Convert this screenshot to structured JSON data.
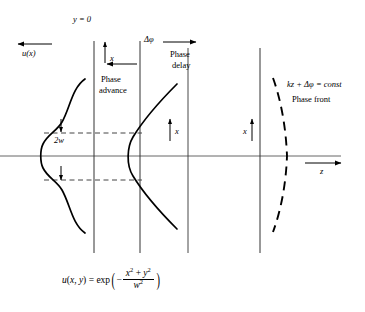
{
  "figure": {
    "axes": {
      "z_axis_label": "z",
      "plane_label": "y = 0"
    },
    "labels": {
      "amplitude": "u(x)",
      "beam_width": "2w",
      "delta_phi": "Δφ",
      "phase_advance_line1": "Phase",
      "phase_advance_line2": "advance",
      "phase_delay_line1": "Phase",
      "phase_delay_line2": "delay",
      "phase_front_condition": "kz + Δφ = const",
      "phase_front_caption": "Phase front",
      "transverse_1": "x",
      "transverse_2": "x",
      "transverse_3": "x",
      "transverse_4": "x"
    },
    "equation": {
      "lhs": "u(x, y) = exp",
      "minus": "−",
      "numerator": "x² + y²",
      "denominator": "w²",
      "full_text": "u(x, y) = exp ( - (x^2 + y^2) / w^2 )"
    },
    "colors": {
      "ink": "#000000",
      "background": "#ffffff",
      "axis": "#555555"
    }
  }
}
